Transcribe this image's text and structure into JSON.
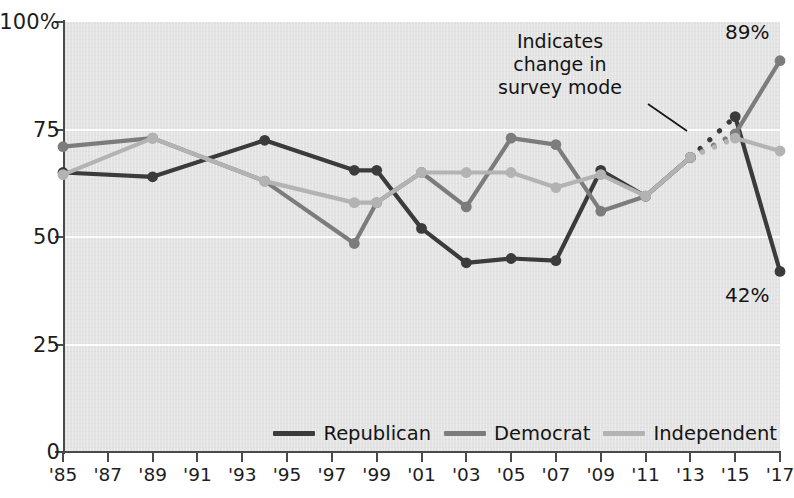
{
  "chart_data": {
    "type": "line",
    "title": "",
    "xlabel": "",
    "ylabel": "",
    "ylim": [
      0,
      100
    ],
    "xlim": [
      1985,
      2017
    ],
    "grid": "horizontal white gridlines at 25, 50, 75",
    "legend_position": "bottom-right inside plot",
    "y_ticks": [
      {
        "value": 100,
        "label": "100%"
      },
      {
        "value": 75,
        "label": "75"
      },
      {
        "value": 50,
        "label": "50"
      },
      {
        "value": 25,
        "label": "25"
      },
      {
        "value": 0,
        "label": "0"
      }
    ],
    "x_ticks": [
      {
        "value": 1985,
        "label": "'85"
      },
      {
        "value": 1987,
        "label": "'87"
      },
      {
        "value": 1989,
        "label": "'89"
      },
      {
        "value": 1991,
        "label": "'91"
      },
      {
        "value": 1993,
        "label": "'93"
      },
      {
        "value": 1995,
        "label": "'95"
      },
      {
        "value": 1997,
        "label": "'97"
      },
      {
        "value": 1999,
        "label": "'99"
      },
      {
        "value": 2001,
        "label": "'01"
      },
      {
        "value": 2003,
        "label": "'03"
      },
      {
        "value": 2005,
        "label": "'05"
      },
      {
        "value": 2007,
        "label": "'07"
      },
      {
        "value": 2009,
        "label": "'09"
      },
      {
        "value": 2011,
        "label": "'11"
      },
      {
        "value": 2013,
        "label": "'13"
      },
      {
        "value": 2015,
        "label": "'15"
      },
      {
        "value": 2017,
        "label": "'17"
      }
    ],
    "series": [
      {
        "name": "Republican",
        "color": "#3b3b3b",
        "points": [
          {
            "x": 1985,
            "y": 65
          },
          {
            "x": 1989,
            "y": 64
          },
          {
            "x": 1994,
            "y": 72.5
          },
          {
            "x": 1998,
            "y": 65.5
          },
          {
            "x": 1999,
            "y": 65.5
          },
          {
            "x": 2001,
            "y": 52
          },
          {
            "x": 2003,
            "y": 44
          },
          {
            "x": 2005,
            "y": 45
          },
          {
            "x": 2007,
            "y": 44.5
          },
          {
            "x": 2009,
            "y": 65.5
          },
          {
            "x": 2011,
            "y": 59.5
          },
          {
            "x": 2013,
            "y": 68.5
          },
          {
            "x": 2015,
            "y": 78
          },
          {
            "x": 2017,
            "y": 42
          }
        ],
        "dashed_segment": {
          "from_x": 2013,
          "to_x": 2015,
          "note": "change in survey mode"
        }
      },
      {
        "name": "Democrat",
        "color": "#7c7c7c",
        "points": [
          {
            "x": 1985,
            "y": 71
          },
          {
            "x": 1989,
            "y": 73
          },
          {
            "x": 1994,
            "y": 63
          },
          {
            "x": 1998,
            "y": 48.5
          },
          {
            "x": 1999,
            "y": 58
          },
          {
            "x": 2001,
            "y": 65
          },
          {
            "x": 2003,
            "y": 57
          },
          {
            "x": 2005,
            "y": 73
          },
          {
            "x": 2007,
            "y": 71.5
          },
          {
            "x": 2009,
            "y": 56
          },
          {
            "x": 2011,
            "y": 59.5
          },
          {
            "x": 2013,
            "y": 68.5
          },
          {
            "x": 2015,
            "y": 74
          },
          {
            "x": 2017,
            "y": 91
          }
        ],
        "dashed_segment": {
          "from_x": 2013,
          "to_x": 2015,
          "note": "change in survey mode"
        }
      },
      {
        "name": "Independent",
        "color": "#b3b3b3",
        "points": [
          {
            "x": 1985,
            "y": 64.5
          },
          {
            "x": 1989,
            "y": 73
          },
          {
            "x": 1994,
            "y": 63
          },
          {
            "x": 1998,
            "y": 58
          },
          {
            "x": 1999,
            "y": 58
          },
          {
            "x": 2001,
            "y": 65
          },
          {
            "x": 2003,
            "y": 65
          },
          {
            "x": 2005,
            "y": 65
          },
          {
            "x": 2007,
            "y": 61.5
          },
          {
            "x": 2009,
            "y": 64.5
          },
          {
            "x": 2011,
            "y": 59.5
          },
          {
            "x": 2013,
            "y": 68.5
          },
          {
            "x": 2015,
            "y": 73
          },
          {
            "x": 2017,
            "y": 70
          }
        ],
        "dashed_segment": {
          "from_x": 2013,
          "to_x": 2015,
          "note": "change in survey mode"
        }
      }
    ],
    "annotations": [
      {
        "name": "survey-mode-note",
        "text_lines": [
          "Indicates",
          "change in",
          "survey mode"
        ],
        "points_to": "dotted line segments between '13 and '15"
      },
      {
        "name": "democrat-end-value",
        "text": "89%",
        "series": "Democrat",
        "x": 2017
      },
      {
        "name": "republican-end-value",
        "text": "42%",
        "series": "Republican",
        "x": 2017
      }
    ]
  },
  "annotation": {
    "line1": "Indicates",
    "line2": "change in",
    "line3": "survey mode"
  },
  "end_labels": {
    "top": "89%",
    "bottom": "42%"
  },
  "legend": {
    "items": [
      {
        "label": "Republican",
        "color": "#3b3b3b"
      },
      {
        "label": "Democrat",
        "color": "#7c7c7c"
      },
      {
        "label": "Independent",
        "color": "#b3b3b3"
      }
    ]
  }
}
